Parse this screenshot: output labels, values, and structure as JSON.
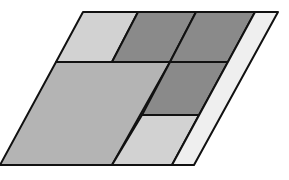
{
  "diagram": {
    "regions": [
      {
        "id": "top-left",
        "shade": "light",
        "color": "#d2d2d2"
      },
      {
        "id": "top-middle",
        "shade": "dark",
        "color": "#8a8a8a"
      },
      {
        "id": "top-right",
        "shade": "dark",
        "color": "#8a8a8a"
      },
      {
        "id": "big-left",
        "shade": "medium",
        "color": "#b4b4b4"
      },
      {
        "id": "middle-right",
        "shade": "dark",
        "color": "#8a8a8a"
      },
      {
        "id": "bottom-right",
        "shade": "light",
        "color": "#d2d2d2"
      },
      {
        "id": "right-strip",
        "shade": "very-light",
        "color": "#efefef"
      }
    ]
  }
}
